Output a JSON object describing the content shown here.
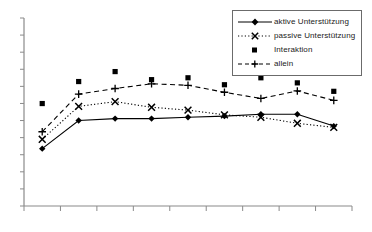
{
  "chart_data": {
    "type": "line",
    "title": "",
    "subtitle": "",
    "xlabel": "",
    "ylabel": "",
    "grid": false,
    "legend_position": "top-right",
    "x": [
      1,
      2,
      3,
      4,
      5,
      6,
      7,
      8,
      9
    ],
    "xlim": [
      0.5,
      9.5
    ],
    "ylim": [
      0,
      10
    ],
    "x_tick_labels": [
      "",
      "",
      "",
      "",
      "",
      "",
      "",
      "",
      "",
      ""
    ],
    "y_tick_labels": [
      "",
      "",
      "",
      "",
      "",
      "",
      "",
      "",
      "",
      "",
      "",
      ""
    ],
    "series": [
      {
        "name": "aktive Unterstützung",
        "marker": "filled-diamond",
        "line": "solid",
        "color": "#000000",
        "values": [
          3.05,
          4.55,
          4.65,
          4.65,
          4.72,
          4.78,
          4.88,
          4.88,
          4.25
        ]
      },
      {
        "name": "passive Unterstützung",
        "marker": "cross-x",
        "line": "dotted",
        "color": "#000000",
        "values": [
          3.55,
          5.3,
          5.55,
          5.25,
          5.1,
          4.85,
          4.72,
          4.4,
          4.18
        ]
      },
      {
        "name": "Interaktion",
        "marker": "filled-square",
        "line": "none",
        "color": "#000000",
        "values": [
          5.45,
          6.62,
          7.15,
          6.72,
          6.82,
          6.45,
          6.82,
          6.55,
          6.1
        ]
      },
      {
        "name": "allein",
        "marker": "plus",
        "line": "dashed",
        "color": "#000000",
        "values": [
          3.95,
          5.95,
          6.25,
          6.5,
          6.42,
          6.05,
          5.72,
          6.12,
          5.62
        ]
      }
    ]
  },
  "legend": {
    "items": [
      {
        "label": "aktive Unterstützung"
      },
      {
        "label": "passive Unterstützung"
      },
      {
        "label": "Interaktion"
      },
      {
        "label": "allein"
      }
    ]
  },
  "axes": {
    "axis_color": "#8a8a8a",
    "tick_color": "#8a8a8a"
  }
}
